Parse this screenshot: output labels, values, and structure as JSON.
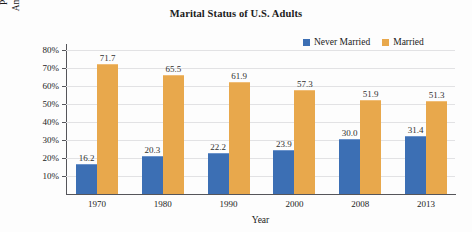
{
  "chart_data": {
    "type": "bar",
    "title": "Marital Status of U.S. Adults",
    "xlabel": "Year",
    "ylabel_lines": [
      "Percentage of",
      "American Adults"
    ],
    "categories": [
      "1970",
      "1980",
      "1990",
      "2000",
      "2008",
      "2013"
    ],
    "series": [
      {
        "name": "Never Married",
        "color": "#3c6fb4",
        "values": [
          16.2,
          20.3,
          22.2,
          23.9,
          30.0,
          31.4
        ]
      },
      {
        "name": "Married",
        "color": "#e8a84c",
        "values": [
          71.7,
          65.5,
          61.9,
          57.3,
          51.9,
          51.3
        ]
      }
    ],
    "value_labels": [
      [
        "16.2",
        "20.3",
        "22.2",
        "23.9",
        "30.0",
        "31.4"
      ],
      [
        "71.7",
        "65.5",
        "61.9",
        "57.3",
        "51.9",
        "51.3"
      ]
    ],
    "ylim": [
      0,
      80
    ],
    "ytick_values": [
      10,
      20,
      30,
      40,
      50,
      60,
      70,
      80
    ],
    "ytick_labels": [
      "10%",
      "20%",
      "30%",
      "40%",
      "50%",
      "60%",
      "70%",
      "80%"
    ],
    "grid": true,
    "legend_position": "top-right"
  }
}
